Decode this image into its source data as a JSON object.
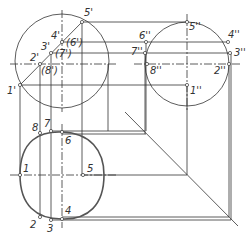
{
  "figure": {
    "type": "orthographic-projection-drawing",
    "views": {
      "front": {
        "labels": [
          "1'",
          "2'",
          "3'",
          "4'",
          "5'",
          "(6')",
          "(7')",
          "(8')"
        ]
      },
      "side": {
        "labels": [
          "1''",
          "2''",
          "3''",
          "4''",
          "5''",
          "6''",
          "7''",
          "8''"
        ]
      },
      "top": {
        "labels": [
          "1",
          "2",
          "3",
          "4",
          "5",
          "6",
          "7",
          "8"
        ]
      }
    }
  },
  "colors": {
    "line": "#333333",
    "thick": "#555555",
    "background": "#ffffff"
  }
}
